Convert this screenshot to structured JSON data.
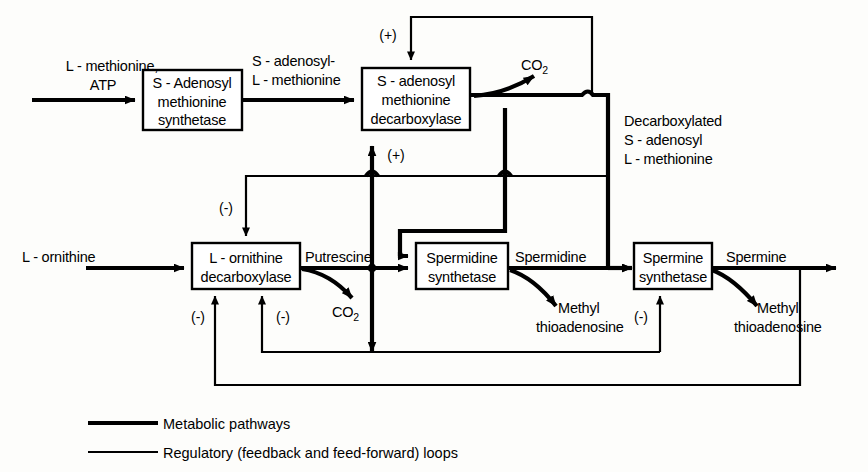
{
  "diagram": {
    "enzymes": [
      {
        "id": "sam-synthetase",
        "lines": [
          "S - Adenosyl",
          "methionine",
          "synthetase"
        ]
      },
      {
        "id": "sam-decarboxylase",
        "lines": [
          "S - adenosyl",
          "methionine",
          "decarboxylase"
        ]
      },
      {
        "id": "ornithine-decarboxylase",
        "lines": [
          "L - ornithine",
          "decarboxylase"
        ]
      },
      {
        "id": "spermidine-synthetase",
        "lines": [
          "Spermidine",
          "synthetase"
        ]
      },
      {
        "id": "spermine-synthetase",
        "lines": [
          "Spermine",
          "synthetase"
        ]
      }
    ],
    "metabolites": {
      "input_methionine_line1": "L - methionine,",
      "input_methionine_line2": "ATP",
      "sam_line1": "S - adenosyl-",
      "sam_line2": "L - methionine",
      "co2_top": "CO",
      "co2_top_sub": "2",
      "decarboxylated_line1": "Decarboxylated",
      "decarboxylated_line2": "S - adenosyl",
      "decarboxylated_line3": "L - methionine",
      "input_ornithine": "L - ornithine",
      "putrescine": "Putrescine",
      "co2_mid": "CO",
      "co2_mid_sub": "2",
      "spermidine": "Spermidine",
      "methyl_thioadenosine_a_line1": "Methyl",
      "methyl_thioadenosine_a_line2": "thioadenosine",
      "spermine": "Spermine",
      "methyl_thioadenosine_b_line1": "Methyl",
      "methyl_thioadenosine_b_line2": "thioadenosine"
    },
    "signs": {
      "plus_top": "(+)",
      "plus_below_decarb": "(+)",
      "minus_ornithine_top": "(-)",
      "minus_ornithine_bottom_left": "(-)",
      "minus_ornithine_bottom_right": "(-)",
      "minus_spermine": "(-)"
    },
    "legend": [
      {
        "id": "metabolic",
        "label": "Metabolic pathways",
        "style": "thick"
      },
      {
        "id": "regulatory",
        "label": "Regulatory (feedback and feed-forward) loops",
        "style": "thin"
      }
    ],
    "colors": {
      "ink": "#000000",
      "paper": "#fdfdfb"
    }
  }
}
